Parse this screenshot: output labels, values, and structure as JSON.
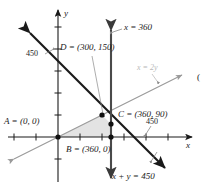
{
  "figure": {
    "type": "graph",
    "axes": {
      "x_axis_label": "x",
      "y_axis_label": "y",
      "x_tick_values": [
        -300,
        -150,
        0,
        150,
        300,
        450,
        600
      ],
      "y_tick_values": [
        -150,
        0,
        150,
        300,
        450,
        600
      ],
      "tick_spacing_units": 150,
      "grid": false
    },
    "axis_value_labels": [
      {
        "name": "y-intercept-450",
        "text": "450",
        "axis": "y"
      },
      {
        "name": "x-intercept-450",
        "text": "450",
        "axis": "x"
      }
    ],
    "lines": [
      {
        "name": "x-equals-360",
        "label": "x = 360",
        "color": "#3a3a3a",
        "style": "solid-thick-arrow-both"
      },
      {
        "name": "x-equals-2y",
        "label": "x = 2y",
        "color": "#9a9a9a",
        "style": "solid-thin-arrow-both"
      },
      {
        "name": "x-plus-y-equals-450",
        "label": "x + y = 450",
        "color": "#1a1a1a",
        "style": "solid-thick-arrow-both"
      }
    ],
    "vertices": [
      {
        "name": "vertex-a",
        "label": "A = (0, 0)",
        "x": 0,
        "y": 0
      },
      {
        "name": "vertex-b",
        "label": "B = (360, 0)",
        "x": 360,
        "y": 0
      },
      {
        "name": "vertex-c",
        "label": "C = (360, 90)",
        "x": 360,
        "y": 90
      },
      {
        "name": "vertex-d",
        "label": "D = (300, 150)",
        "x": 300,
        "y": 150
      }
    ],
    "shaded_region": {
      "name": "feasible-region",
      "fill": "#e2e2e2",
      "polygon": "A-B-C-D"
    },
    "margin_mark": {
      "name": "margin-paren",
      "text": "("
    }
  }
}
